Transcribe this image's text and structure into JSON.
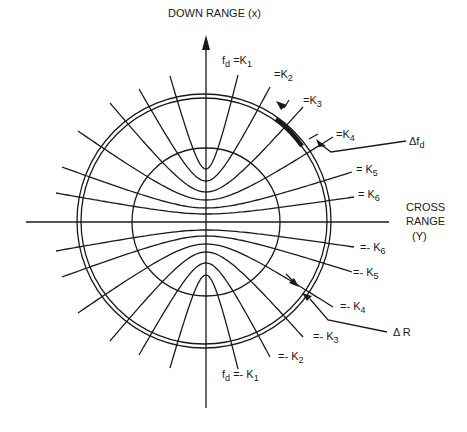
{
  "axes": {
    "down_range_label": "DOWN RANGE (x)",
    "cross_range_label_line1": "CROSS",
    "cross_range_label_line2": "RANGE",
    "cross_range_label_line3": "(Y)"
  },
  "doppler_contours": {
    "upper": [
      {
        "id": "K1",
        "prefix": "f",
        "sub_prefix": "d",
        "eq": " =K",
        "sub": "1"
      },
      {
        "id": "K2",
        "prefix": "",
        "sub_prefix": "",
        "eq": "=K",
        "sub": "2"
      },
      {
        "id": "K3",
        "prefix": "",
        "sub_prefix": "",
        "eq": "=K",
        "sub": "3"
      },
      {
        "id": "K4",
        "prefix": "",
        "sub_prefix": "",
        "eq": "=K",
        "sub": "4"
      },
      {
        "id": "K5",
        "prefix": "",
        "sub_prefix": "",
        "eq": "= K",
        "sub": "5"
      },
      {
        "id": "K6",
        "prefix": "",
        "sub_prefix": "",
        "eq": "= K",
        "sub": "6"
      }
    ],
    "lower": [
      {
        "id": "-K6",
        "prefix": "",
        "sub_prefix": "",
        "eq": "=- K",
        "sub": "6"
      },
      {
        "id": "-K5",
        "prefix": "",
        "sub_prefix": "",
        "eq": "=- K",
        "sub": "5"
      },
      {
        "id": "-K4",
        "prefix": "",
        "sub_prefix": "",
        "eq": "=- K",
        "sub": "4"
      },
      {
        "id": "-K3",
        "prefix": "",
        "sub_prefix": "",
        "eq": "=- K",
        "sub": "3"
      },
      {
        "id": "-K2",
        "prefix": "",
        "sub_prefix": "",
        "eq": "=- K",
        "sub": "2"
      },
      {
        "id": "-K1",
        "prefix": "f",
        "sub_prefix": "d",
        "eq": " =- K",
        "sub": "1"
      }
    ]
  },
  "annotations": {
    "delta_fd": {
      "delta": "Δf",
      "sub": "d"
    },
    "delta_r": {
      "text": "Δ R"
    }
  }
}
